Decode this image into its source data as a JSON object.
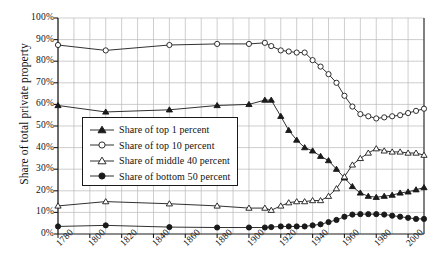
{
  "chart_data": {
    "type": "line",
    "title": "",
    "xlabel": "",
    "ylabel": "Share of total private property",
    "xlim": [
      1780,
      2010
    ],
    "ylim": [
      0,
      1.0
    ],
    "grid": true,
    "legend_position": "inner-left",
    "y_tick_labels": [
      "100%",
      "90%",
      "80%",
      "70%",
      "60%",
      "50%",
      "40%",
      "30%",
      "20%",
      "10%",
      "0%"
    ],
    "y_tick_values": [
      100,
      90,
      80,
      70,
      60,
      50,
      40,
      30,
      20,
      10,
      0
    ],
    "x_tick_labels": [
      "1780",
      "1800",
      "1820",
      "1840",
      "1860",
      "1880",
      "1900",
      "1920",
      "1940",
      "1960",
      "1980",
      "2000"
    ],
    "x_tick_values": [
      1780,
      1800,
      1820,
      1840,
      1860,
      1880,
      1900,
      1920,
      1940,
      1960,
      1980,
      2000
    ],
    "series": [
      {
        "name": "Share of top 1 percent",
        "marker": "filled-triangle",
        "x": [
          1780,
          1810,
          1850,
          1880,
          1900,
          1910,
          1914,
          1920,
          1925,
          1930,
          1935,
          1940,
          1945,
          1950,
          1955,
          1960,
          1965,
          1970,
          1975,
          1980,
          1985,
          1990,
          1995,
          2000,
          2005,
          2010
        ],
        "values": [
          59.5,
          56.5,
          57.5,
          59.5,
          60.0,
          62.0,
          62.0,
          54.5,
          48.0,
          43.5,
          40.0,
          38.5,
          36.0,
          34.0,
          30.0,
          26.0,
          22.0,
          19.0,
          17.5,
          17.0,
          17.5,
          18.0,
          19.0,
          19.5,
          20.5,
          21.5
        ]
      },
      {
        "name": "Share of top 10 percent",
        "marker": "open-circle",
        "x": [
          1780,
          1810,
          1850,
          1880,
          1900,
          1910,
          1914,
          1920,
          1925,
          1930,
          1935,
          1940,
          1945,
          1950,
          1955,
          1960,
          1965,
          1970,
          1975,
          1980,
          1985,
          1990,
          1995,
          2000,
          2005,
          2010
        ],
        "values": [
          87.5,
          85.0,
          87.5,
          88.0,
          88.0,
          88.5,
          87.0,
          85.0,
          84.5,
          84.0,
          84.0,
          80.5,
          77.5,
          74.0,
          70.0,
          64.0,
          59.0,
          55.5,
          54.5,
          53.5,
          54.0,
          54.5,
          55.0,
          56.0,
          57.0,
          58.0
        ]
      },
      {
        "name": "Share of middle 40 percent",
        "marker": "open-triangle",
        "x": [
          1780,
          1810,
          1850,
          1880,
          1900,
          1910,
          1914,
          1920,
          1925,
          1930,
          1935,
          1940,
          1945,
          1950,
          1955,
          1960,
          1965,
          1970,
          1975,
          1980,
          1985,
          1990,
          1995,
          2000,
          2005,
          2010
        ],
        "values": [
          13.0,
          15.0,
          14.0,
          13.0,
          12.0,
          12.0,
          11.0,
          13.0,
          14.5,
          15.0,
          15.0,
          15.5,
          15.5,
          17.5,
          21.0,
          26.5,
          32.0,
          35.0,
          37.5,
          39.5,
          38.5,
          38.0,
          38.0,
          37.5,
          37.5,
          36.5
        ]
      },
      {
        "name": "Share of bottom 50 percent",
        "marker": "filled-circle",
        "x": [
          1780,
          1810,
          1850,
          1880,
          1900,
          1910,
          1914,
          1920,
          1925,
          1930,
          1935,
          1940,
          1945,
          1950,
          1955,
          1960,
          1965,
          1970,
          1975,
          1980,
          1985,
          1990,
          1995,
          2000,
          2005,
          2010
        ],
        "values": [
          3.5,
          4.0,
          3.2,
          3.0,
          3.0,
          3.0,
          3.2,
          3.5,
          3.5,
          3.5,
          3.5,
          4.0,
          4.5,
          5.5,
          6.5,
          8.0,
          9.0,
          9.2,
          9.2,
          9.2,
          9.0,
          8.5,
          8.0,
          7.5,
          7.0,
          7.0
        ]
      }
    ]
  },
  "legend": {
    "items": [
      {
        "label": "Share of top 1 percent",
        "marker": "filled-triangle"
      },
      {
        "label": "Share of top 10 percent",
        "marker": "open-circle"
      },
      {
        "label": "Share of middle 40 percent",
        "marker": "open-triangle"
      },
      {
        "label": "Share of bottom 50 percent",
        "marker": "filled-circle"
      }
    ]
  },
  "colors": {
    "line": "#1a1a1a",
    "grid": "#b9b9b9",
    "axis": "#1a1a1a",
    "background": "#ffffff"
  }
}
